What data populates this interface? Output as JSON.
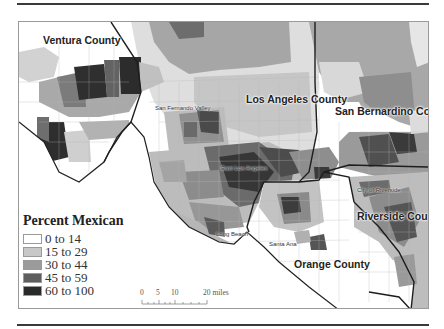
{
  "map": {
    "subject": "Percent Mexican",
    "counties": [
      {
        "name": "Ventura County",
        "x": 24,
        "y": 12
      },
      {
        "name": "Los Angeles County",
        "x": 227,
        "y": 71
      },
      {
        "name": "San Bernardino County",
        "x": 316,
        "y": 83
      },
      {
        "name": "Riverside County",
        "x": 338,
        "y": 188
      },
      {
        "name": "Orange County",
        "x": 275,
        "y": 236
      }
    ],
    "cities": [
      {
        "name": "San Fernando Valley",
        "x": 136,
        "y": 83
      },
      {
        "name": "East Los Angeles",
        "x": 222,
        "y": 144
      },
      {
        "name": "Long Beach",
        "x": 220,
        "y": 222
      },
      {
        "name": "Santa Ana",
        "x": 272,
        "y": 230
      },
      {
        "name": "City of Riverside",
        "x": 362,
        "y": 166
      }
    ]
  },
  "legend": {
    "title": "Percent Mexican",
    "items": [
      {
        "label": "0 to 14",
        "color": "#ffffff"
      },
      {
        "label": "15 to 29",
        "color": "#c8c8c8"
      },
      {
        "label": "30 to 44",
        "color": "#9b9b9b"
      },
      {
        "label": "45 to 59",
        "color": "#5e5e5e"
      },
      {
        "label": "60 to 100",
        "color": "#2a2a2a"
      }
    ]
  },
  "scale_bar": {
    "ticks": [
      "0",
      "5",
      "10",
      "20 miles"
    ],
    "unit": "miles"
  }
}
